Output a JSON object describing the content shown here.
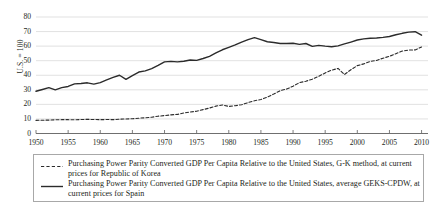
{
  "chart_data": {
    "type": "line",
    "title": "",
    "xlabel": "",
    "ylabel": "U.S. = 100",
    "xlim": [
      1950,
      2011
    ],
    "ylim": [
      0,
      80
    ],
    "ytick_values": [
      0,
      10,
      20,
      30,
      40,
      50,
      60,
      70,
      80
    ],
    "ytick_labels": [
      "0",
      "10",
      "20",
      "30",
      "40",
      "50",
      "60",
      "70",
      "80"
    ],
    "xtick_values": [
      1950,
      1955,
      1960,
      1965,
      1970,
      1975,
      1980,
      1985,
      1990,
      1995,
      2000,
      2005,
      2010
    ],
    "xtick_labels": [
      "1950",
      "1955",
      "1960",
      "1965",
      "1970",
      "1975",
      "1980",
      "1985",
      "1990",
      "1995",
      "2000",
      "2005",
      "2010"
    ],
    "grid": "horizontal",
    "legend_position": "below",
    "series": [
      {
        "name": "korea",
        "label": "Purchasing Power Parity Converted GDP Per Capita Relative to the United States, G-K method, at current prices for Republic of Korea",
        "style": "dashed",
        "color": "#2b2b2b",
        "x": [
          1950,
          1951,
          1952,
          1953,
          1954,
          1955,
          1956,
          1957,
          1958,
          1959,
          1960,
          1961,
          1962,
          1963,
          1964,
          1965,
          1966,
          1967,
          1968,
          1969,
          1970,
          1971,
          1972,
          1973,
          1974,
          1975,
          1976,
          1977,
          1978,
          1979,
          1980,
          1981,
          1982,
          1983,
          1984,
          1985,
          1986,
          1987,
          1988,
          1989,
          1990,
          1991,
          1992,
          1993,
          1994,
          1995,
          1996,
          1997,
          1998,
          1999,
          2000,
          2001,
          2002,
          2003,
          2004,
          2005,
          2006,
          2007,
          2008,
          2009,
          2010
        ],
        "values": [
          9.0,
          9.1,
          9.2,
          9.4,
          9.5,
          9.5,
          9.4,
          9.6,
          9.7,
          9.6,
          9.5,
          9.6,
          9.5,
          9.8,
          10.0,
          10.1,
          10.5,
          10.8,
          11.2,
          11.9,
          12.3,
          12.8,
          13.1,
          14.1,
          14.8,
          15.3,
          16.4,
          17.5,
          18.8,
          19.6,
          18.6,
          19.1,
          19.8,
          21.2,
          22.5,
          23.3,
          25.0,
          27.1,
          29.4,
          30.5,
          32.5,
          34.9,
          35.9,
          37.3,
          39.3,
          41.6,
          43.5,
          44.7,
          40.5,
          43.8,
          46.6,
          47.8,
          49.5,
          50.2,
          51.7,
          53.0,
          54.8,
          56.6,
          57.3,
          57.4,
          59.4
        ]
      },
      {
        "name": "spain",
        "label": "Purchasing Power Parity Converted GDP Per Capita Relative to the United States, average GEKS-CPDW, at current prices for Spain",
        "style": "solid",
        "color": "#2b2b2b",
        "x": [
          1950,
          1951,
          1952,
          1953,
          1954,
          1955,
          1956,
          1957,
          1958,
          1959,
          1960,
          1961,
          1962,
          1963,
          1964,
          1965,
          1966,
          1967,
          1968,
          1969,
          1970,
          1971,
          1972,
          1973,
          1974,
          1975,
          1976,
          1977,
          1978,
          1979,
          1980,
          1981,
          1982,
          1983,
          1984,
          1985,
          1986,
          1987,
          1988,
          1989,
          1990,
          1991,
          1992,
          1993,
          1994,
          1995,
          1996,
          1997,
          1998,
          1999,
          2000,
          2001,
          2002,
          2003,
          2004,
          2005,
          2006,
          2007,
          2008,
          2009,
          2010
        ],
        "values": [
          29.0,
          30.2,
          31.5,
          30.0,
          31.5,
          32.3,
          34.1,
          34.3,
          34.8,
          33.9,
          34.9,
          36.8,
          38.5,
          40.0,
          37.2,
          39.8,
          42.2,
          43.0,
          44.6,
          46.8,
          49.2,
          49.5,
          49.2,
          49.6,
          50.5,
          50.2,
          51.5,
          53.0,
          55.3,
          57.5,
          59.1,
          60.8,
          62.8,
          64.5,
          65.8,
          64.5,
          63.0,
          62.5,
          61.8,
          61.8,
          62.0,
          61.2,
          61.8,
          59.8,
          60.5,
          60.0,
          59.6,
          60.2,
          61.5,
          62.8,
          64.2,
          65.0,
          65.4,
          65.6,
          66.0,
          66.6,
          67.8,
          68.8,
          69.6,
          69.9,
          67.5
        ]
      }
    ]
  }
}
